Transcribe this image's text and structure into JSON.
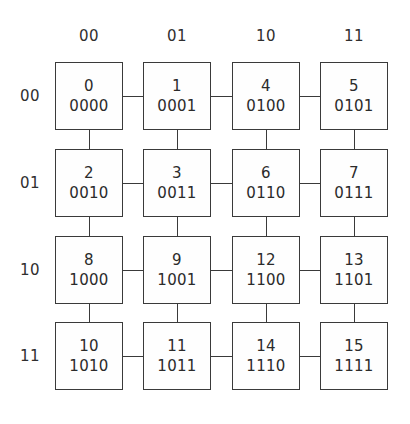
{
  "chart_data": {
    "type": "diagram",
    "title": "",
    "subtitle": "",
    "xlabel": "",
    "ylabel": "",
    "diagram_kind": "4x4-mesh-node-grid",
    "grid": {
      "rows": 4,
      "cols": 4
    },
    "column_headers": [
      "00",
      "01",
      "10",
      "11"
    ],
    "row_headers": [
      "00",
      "01",
      "10",
      "11"
    ],
    "nodes": [
      {
        "row": 0,
        "col": 0,
        "decimal": "0",
        "binary": "0000"
      },
      {
        "row": 0,
        "col": 1,
        "decimal": "1",
        "binary": "0001"
      },
      {
        "row": 0,
        "col": 2,
        "decimal": "4",
        "binary": "0100"
      },
      {
        "row": 0,
        "col": 3,
        "decimal": "5",
        "binary": "0101"
      },
      {
        "row": 1,
        "col": 0,
        "decimal": "2",
        "binary": "0010"
      },
      {
        "row": 1,
        "col": 1,
        "decimal": "3",
        "binary": "0011"
      },
      {
        "row": 1,
        "col": 2,
        "decimal": "6",
        "binary": "0110"
      },
      {
        "row": 1,
        "col": 3,
        "decimal": "7",
        "binary": "0111"
      },
      {
        "row": 2,
        "col": 0,
        "decimal": "8",
        "binary": "1000"
      },
      {
        "row": 2,
        "col": 1,
        "decimal": "9",
        "binary": "1001"
      },
      {
        "row": 2,
        "col": 2,
        "decimal": "12",
        "binary": "1100"
      },
      {
        "row": 2,
        "col": 3,
        "decimal": "13",
        "binary": "1101"
      },
      {
        "row": 3,
        "col": 0,
        "decimal": "10",
        "binary": "1010"
      },
      {
        "row": 3,
        "col": 1,
        "decimal": "11",
        "binary": "1011"
      },
      {
        "row": 3,
        "col": 2,
        "decimal": "14",
        "binary": "1110"
      },
      {
        "row": 3,
        "col": 3,
        "decimal": "15",
        "binary": "1111"
      }
    ],
    "edges": {
      "horizontal_per_row": 3,
      "vertical_per_col": 3,
      "total": 24
    },
    "colors": {
      "background": "#ffffff",
      "node_border": "#3a3a3a",
      "node_fill": "#fefefe",
      "link": "#3a3a3a",
      "text": "#2b2b2b",
      "header_text": "#2f2f2f"
    },
    "layout": {
      "box_size": 68,
      "col_x": [
        55,
        143,
        232,
        320
      ],
      "row_y": [
        62,
        149,
        236,
        322
      ]
    }
  }
}
